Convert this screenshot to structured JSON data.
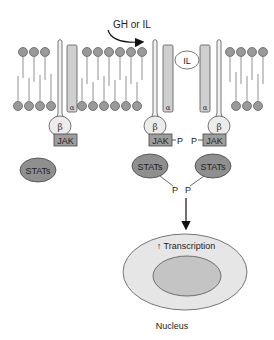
{
  "diagram": {
    "ligand_label": "GH or IL",
    "bound_ligand_label": "IL",
    "alpha_label": "α",
    "beta_label": "β",
    "jak_label": "JAK",
    "stats_label": "STATs",
    "phosphate_label": "P",
    "transcription_label": "↑ Transcription",
    "nucleus_label": "Nucleus",
    "receptors": [
      {
        "id": "inactive-receptor",
        "alpha": "α",
        "beta": "β",
        "jak": "JAK",
        "stats": "STATs",
        "phosphorylated": false
      },
      {
        "id": "active-receptor-left",
        "alpha": "α",
        "beta": "β",
        "jak": "JAK",
        "stats": "STATs",
        "phosphorylated": true
      },
      {
        "id": "active-receptor-right",
        "alpha": "α",
        "beta": "β",
        "jak": "JAK",
        "stats": "STATs",
        "phosphorylated": true
      }
    ],
    "colors": {
      "lipid_head": "#9a9a9a",
      "alpha_subunit": "#cfcfcf",
      "beta_subunit": "#ececec",
      "jak": "#9e9e9e",
      "stats": "#8f8f8f",
      "nucleus_outer": "#e6e6e6",
      "nucleus_inner": "#c4c4c4",
      "stroke": "#555555"
    }
  }
}
